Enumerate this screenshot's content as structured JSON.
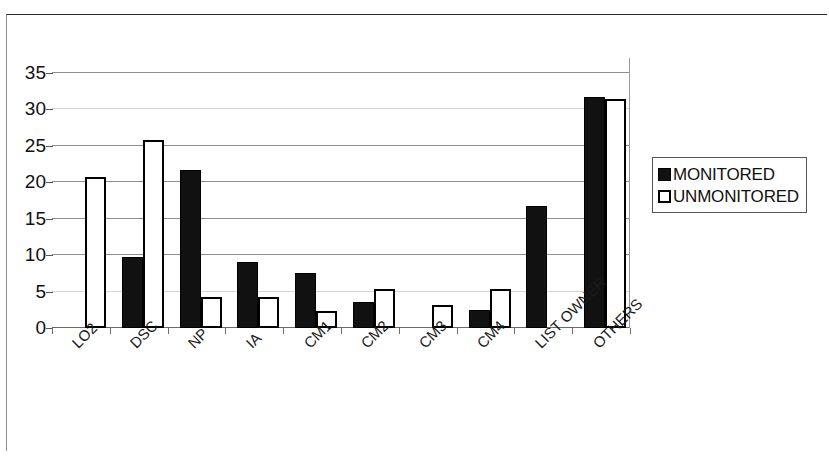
{
  "chart_data": {
    "type": "bar",
    "title": "",
    "xlabel": "",
    "ylabel": "",
    "ylim": [
      0,
      37
    ],
    "yticks": [
      0,
      5,
      10,
      15,
      20,
      25,
      30,
      35
    ],
    "grid": true,
    "legend_position": "right",
    "categories": [
      "LO2",
      "DSC",
      "NP",
      "IA",
      "CM1",
      "CM2",
      "CM3",
      "CM4",
      "LIST OWNER",
      "OTHERS"
    ],
    "series": [
      {
        "name": "MONITORED",
        "color": "#111111",
        "style": "filled",
        "values": [
          0,
          9.7,
          21.7,
          9.0,
          7.6,
          3.5,
          0,
          2.5,
          16.7,
          31.7
        ]
      },
      {
        "name": "UNMONITORED",
        "color": "#ffffff",
        "style": "hollow",
        "values": [
          20.7,
          25.7,
          4.3,
          4.3,
          2.4,
          5.3,
          3.2,
          5.3,
          0,
          31.4
        ]
      }
    ]
  },
  "legend": {
    "items": [
      {
        "label": "MONITORED",
        "swatch": "filled-square-icon"
      },
      {
        "label": "UNMONITORED",
        "swatch": "hollow-square-icon"
      }
    ]
  },
  "axis": {
    "y_tick_labels": [
      "35",
      "30",
      "25",
      "20",
      "15",
      "10",
      "5",
      "0"
    ]
  }
}
